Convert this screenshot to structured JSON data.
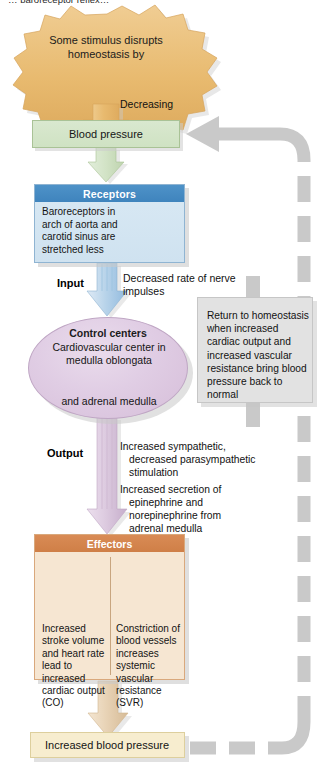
{
  "diagram": {
    "title_cropped": "… baroreceptor reflex…",
    "stimulus": {
      "text": "Some stimulus disrupts homeostasis by",
      "shape": "starburst",
      "color": "#e8b96b"
    },
    "decreasing_label": "Decreasing",
    "blood_pressure_box": {
      "label": "Blood pressure",
      "color": "#d3e4c7"
    },
    "receptors": {
      "header": "Receptors",
      "header_color": "#4487c0",
      "body": "Baroreceptors in arch of aorta and carotid sinus are stretched less",
      "icon": "heart-aorta-illustration"
    },
    "input_label": "Input",
    "input_description": "Decreased rate of nerve impulses",
    "control_centers": {
      "title": "Control centers",
      "subtitle": "Cardiovascular center in medulla oblongata",
      "bottom": "and adrenal medulla",
      "color": "#dcc6e0",
      "icon": "brainstem-illustration"
    },
    "return_box": {
      "text": "Return to homeostasis when increased cardiac output and increased vascular resistance bring blood pressure back to normal",
      "color": "#e2e2e2"
    },
    "output_label": "Output",
    "output_description_1": {
      "line1": "Increased sympathetic,",
      "line2": "decreased parasympathetic",
      "line3": "stimulation"
    },
    "output_description_2": {
      "line1": "Increased secretion of",
      "line2": "epinephrine and",
      "line3": "norepinephrine from",
      "line4": "adrenal medulla"
    },
    "effectors": {
      "header": "Effectors",
      "header_color": "#d2824c",
      "panel_color": "#f6e6d2",
      "left_column": {
        "text": "Increased stroke volume and heart rate lead to increased cardiac output (CO)",
        "icon": "heart-illustration"
      },
      "right_column": {
        "text": "Constriction of blood vessels increases systemic vascular resistance (SVR)",
        "icon": "blood-vessel-illustration"
      }
    },
    "final_box": {
      "label": "Increased blood pressure",
      "color": "#f7edcf"
    },
    "feedback_arrow": {
      "style": "dashed",
      "color": "#c8c8c8",
      "direction": "upward-return-to-blood-pressure"
    }
  }
}
